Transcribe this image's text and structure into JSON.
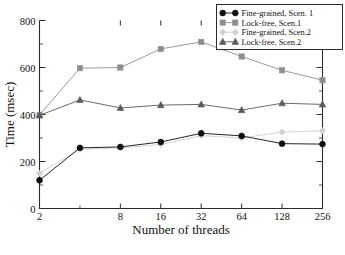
{
  "chart_data": {
    "type": "line",
    "title": "",
    "xlabel": "Number of threads",
    "ylabel": "Time (msec)",
    "x": [
      2,
      4,
      8,
      16,
      32,
      64,
      128,
      256
    ],
    "xtick_labels": [
      "2",
      "8",
      "16",
      "32",
      "64",
      "128",
      "256"
    ],
    "xticks": [
      2,
      8,
      16,
      32,
      64,
      128,
      256
    ],
    "ytick_labels": [
      "0",
      "200",
      "400",
      "600",
      "800"
    ],
    "yticks": [
      0,
      200,
      400,
      600,
      800
    ],
    "ylim": [
      0,
      800
    ],
    "xscale": "log2",
    "grid": false,
    "legend_position": "top-right",
    "series": [
      {
        "name": "Fine-grained, Scen. 1",
        "marker": "circle",
        "color": "#0d0d0d",
        "values": [
          120,
          258,
          262,
          283,
          320,
          309,
          276,
          274
        ]
      },
      {
        "name": "Lock-free, Scen.1",
        "marker": "square",
        "color": "#8f8f8f",
        "values": [
          398,
          597,
          600,
          679,
          709,
          647,
          588,
          546
        ]
      },
      {
        "name": "Fine-grained, Scen.2",
        "marker": "diamond",
        "color": "#cfcfcf",
        "values": [
          150,
          252,
          258,
          272,
          310,
          300,
          325,
          331
        ]
      },
      {
        "name": "Lock-free, Scen.2",
        "marker": "triangle",
        "color": "#5a5a5a",
        "values": [
          396,
          462,
          428,
          440,
          443,
          419,
          448,
          443
        ]
      }
    ]
  },
  "legend": {
    "entries": [
      {
        "label": "Fine-grained, Scen. 1"
      },
      {
        "label": "Lock-free, Scen.1"
      },
      {
        "label": "Fine-grained, Scen.2"
      },
      {
        "label": "Lock-free, Scen.2"
      }
    ]
  }
}
